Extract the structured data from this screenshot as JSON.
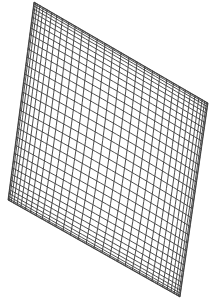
{
  "figure": {
    "width": 217,
    "height": 301,
    "background": "#ffffff",
    "stroke": "#3a3a3a",
    "stroke_width": 0.9,
    "corners": {
      "top": [
        34,
        2
      ],
      "right": [
        208,
        103
      ],
      "bottom": [
        180,
        297
      ],
      "left": [
        8,
        200
      ]
    },
    "center_control": [
      110,
      150
    ],
    "u_lines": 34,
    "v_lines": 34
  }
}
